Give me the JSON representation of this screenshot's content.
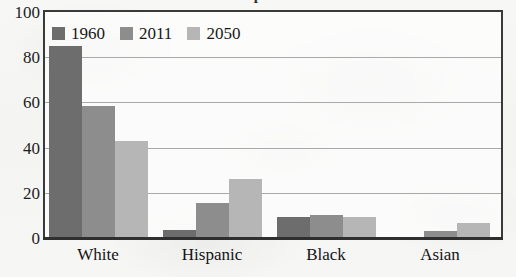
{
  "figure": {
    "title_fragment": "p",
    "background_note": "scanned-page",
    "frame_color": "#3a3a3a",
    "gridline_color": "#a9a9a9"
  },
  "legend": {
    "position": "top-left-inside",
    "entries": [
      {
        "label": "1960",
        "color": "#6d6d6d",
        "swatch_name": "legend-swatch-1960"
      },
      {
        "label": "2011",
        "color": "#8d8d8d",
        "swatch_name": "legend-swatch-2011"
      },
      {
        "label": "2050",
        "color": "#b6b6b6",
        "swatch_name": "legend-swatch-2050"
      }
    ]
  },
  "chart_data": {
    "type": "bar",
    "title": "",
    "xlabel": "",
    "ylabel": "",
    "ylim": [
      0,
      100
    ],
    "yticks": [
      "0",
      "20",
      "40",
      "60",
      "80",
      "100"
    ],
    "ytick_values": [
      0,
      20,
      40,
      60,
      80,
      100
    ],
    "grid": true,
    "legend_position": "upper left",
    "categories": [
      "White",
      "Hispanic",
      "Black",
      "Asian"
    ],
    "series": [
      {
        "name": "1960",
        "color": "#6d6d6d",
        "values": [
          85,
          3.5,
          9.5,
          0.5
        ]
      },
      {
        "name": "2011",
        "color": "#8d8d8d",
        "values": [
          58.5,
          15.5,
          10,
          3
        ]
      },
      {
        "name": "2050",
        "color": "#b6b6b6",
        "values": [
          43,
          26,
          9.5,
          6.5
        ]
      }
    ]
  }
}
